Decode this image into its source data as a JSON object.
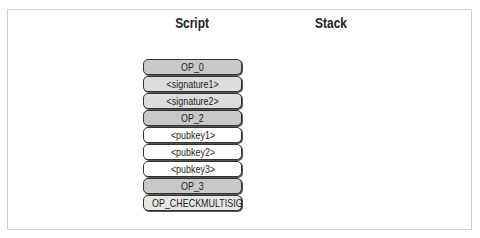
{
  "headers": {
    "script": "Script",
    "stack": "Stack"
  },
  "script_items": [
    {
      "label": "OP_0",
      "fill": "#c8c8c8"
    },
    {
      "label": "<signature1>",
      "fill": "#dcdcdc"
    },
    {
      "label": "<signature2>",
      "fill": "#dcdcdc"
    },
    {
      "label": "OP_2",
      "fill": "#c8c8c8"
    },
    {
      "label": "<pubkey1>",
      "fill": "#ffffff"
    },
    {
      "label": "<pubkey2>",
      "fill": "#ffffff"
    },
    {
      "label": "<pubkey3>",
      "fill": "#ffffff"
    },
    {
      "label": "OP_3",
      "fill": "#c8c8c8"
    },
    {
      "label": "OP_CHECKMULTISIG",
      "fill": "#e6e6e6"
    }
  ],
  "stack_items": []
}
